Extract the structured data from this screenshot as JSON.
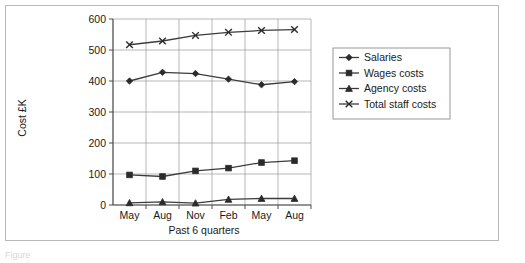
{
  "figure": {
    "caption": "Figure ",
    "border_color": "#b9b9b9"
  },
  "chart_data": {
    "type": "line",
    "title": "",
    "xlabel": "Past 6 quarters",
    "ylabel": "Cost £K",
    "categories": [
      "May",
      "Aug",
      "Nov",
      "Feb",
      "May",
      "Aug"
    ],
    "ylim": [
      0,
      600
    ],
    "yticks": [
      0,
      100,
      200,
      300,
      400,
      500,
      600
    ],
    "ytick_labels": [
      "0",
      "100",
      "200",
      "300",
      "400",
      "500",
      "600"
    ],
    "grid": true,
    "legend_position": "right",
    "series": [
      {
        "name": "Salaries",
        "marker": "diamond",
        "color": "#2b2b2b",
        "values": [
          400,
          428,
          424,
          406,
          388,
          398
        ]
      },
      {
        "name": "Wages costs",
        "marker": "square",
        "color": "#2b2b2b",
        "values": [
          97,
          92,
          110,
          119,
          137,
          143
        ]
      },
      {
        "name": "Agency costs",
        "marker": "triangle",
        "color": "#2b2b2b",
        "values": [
          7,
          10,
          6,
          18,
          21,
          21
        ]
      },
      {
        "name": "Total staff costs",
        "marker": "x",
        "color": "#2b2b2b",
        "values": [
          517,
          529,
          547,
          557,
          563,
          566
        ]
      }
    ]
  }
}
